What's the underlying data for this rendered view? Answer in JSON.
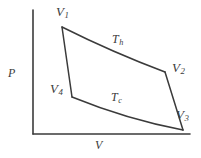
{
  "figure": {
    "background_color": "#ffffff",
    "line_color": "#3b3b3b",
    "width": 201,
    "height": 158
  },
  "axes": {
    "y_label": "P",
    "x_label": "V",
    "origin": [
      33,
      134
    ],
    "y_axis_top": [
      33,
      10
    ],
    "x_axis_right": [
      190,
      134
    ],
    "grid": false,
    "ticks": []
  },
  "labels": {
    "v1": {
      "symbol": "V",
      "subscript": "1"
    },
    "v2": {
      "symbol": "V",
      "subscript": "2"
    },
    "v3": {
      "symbol": "V",
      "subscript": "3"
    },
    "v4": {
      "symbol": "V",
      "subscript": "4"
    },
    "th": {
      "symbol": "T",
      "subscript": "h"
    },
    "tc": {
      "symbol": "T",
      "subscript": "c"
    }
  },
  "chart_data": {
    "type": "line",
    "xlabel": "V",
    "ylabel": "P",
    "grid": false,
    "legend": null,
    "xlim": [
      33,
      190
    ],
    "ylim": [
      134,
      10
    ],
    "points": [
      {
        "name": "V1",
        "x": 62,
        "y": 27
      },
      {
        "name": "V2",
        "x": 165,
        "y": 72
      },
      {
        "name": "V3",
        "x": 183,
        "y": 130
      },
      {
        "name": "V4",
        "x": 72,
        "y": 97
      }
    ],
    "series": [
      {
        "name": "Th",
        "kind": "isotherm",
        "from": "V1",
        "to": "V2",
        "path": "M 62 27 C 90 41, 125 57, 165 72"
      },
      {
        "name": "V1-V4",
        "kind": "adiabat",
        "from": "V1",
        "to": "V4",
        "path": "M 62 27 L 72 97"
      },
      {
        "name": "Tc",
        "kind": "isotherm",
        "from": "V4",
        "to": "V3",
        "path": "M 72 97 C 104 110, 146 123, 183 130"
      },
      {
        "name": "V2-V3",
        "kind": "adiabat",
        "from": "V2",
        "to": "V3",
        "path": "M 165 72 L 183 130"
      }
    ],
    "annotations": [
      {
        "text": "V1",
        "x": 60,
        "y": 12
      },
      {
        "text": "V2",
        "x": 181,
        "y": 70
      },
      {
        "text": "V3",
        "x": 186,
        "y": 116
      },
      {
        "text": "V4",
        "x": 57,
        "y": 90
      },
      {
        "text": "Th",
        "x": 122,
        "y": 42
      },
      {
        "text": "Tc",
        "x": 121,
        "y": 100
      }
    ]
  }
}
